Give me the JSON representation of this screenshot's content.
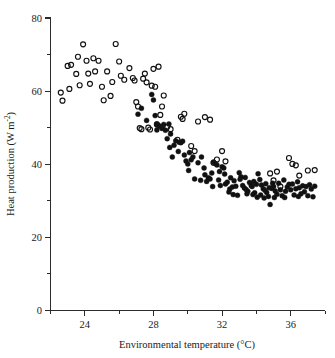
{
  "figure": {
    "title": "",
    "background_color": "#ffffff",
    "ink_color": "#111111"
  },
  "axes": {
    "x": {
      "label_text": "Environmental temperature (",
      "label_unit": "°C)",
      "label_full": "Environmental temperature (°C)",
      "min": 22,
      "max": 38,
      "major_ticks": [
        24,
        28,
        32,
        36
      ],
      "major_tick_labels": [
        "24",
        "28",
        "32",
        "36"
      ],
      "minor_ticks": [
        22,
        26,
        30,
        34,
        38
      ]
    },
    "y": {
      "label_base": "Heat production (W m",
      "label_sup": "-2",
      "label_close": ")",
      "label_full": "Heat production (W m⁻²)",
      "min": 0,
      "max": 80,
      "major_ticks": [
        0,
        20,
        40,
        60,
        80
      ],
      "major_tick_labels": [
        "0",
        "20",
        "40",
        "60",
        "80"
      ],
      "minor_ticks": [
        10,
        30,
        50,
        70
      ]
    }
  },
  "legend": {
    "present": false,
    "series_markers": [
      "open-circle",
      "filled-circle"
    ]
  },
  "chart_data": {
    "type": "scatter",
    "title": "",
    "xlabel": "Environmental temperature (°C)",
    "ylabel": "Heat production (W m⁻²)",
    "xlim": [
      22,
      38
    ],
    "ylim": [
      0,
      80
    ],
    "grid": false,
    "legend_position": "none",
    "series": [
      {
        "name": "Open circles",
        "marker": "open-circle",
        "color": "#111111",
        "points": [
          [
            22.6,
            59.6
          ],
          [
            22.7,
            57.4
          ],
          [
            23.0,
            66.9
          ],
          [
            23.1,
            60.6
          ],
          [
            23.2,
            67.2
          ],
          [
            23.5,
            64.7
          ],
          [
            23.6,
            69.4
          ],
          [
            23.7,
            61.6
          ],
          [
            23.9,
            72.8
          ],
          [
            24.1,
            68.3
          ],
          [
            24.2,
            64.8
          ],
          [
            24.3,
            62.0
          ],
          [
            24.5,
            69.0
          ],
          [
            24.6,
            65.4
          ],
          [
            24.8,
            68.3
          ],
          [
            25.0,
            61.2
          ],
          [
            25.1,
            57.5
          ],
          [
            25.3,
            65.4
          ],
          [
            25.5,
            58.7
          ],
          [
            25.6,
            62.5
          ],
          [
            25.8,
            72.9
          ],
          [
            26.0,
            68.1
          ],
          [
            26.1,
            64.2
          ],
          [
            26.3,
            63.1
          ],
          [
            26.6,
            66.3
          ],
          [
            26.8,
            63.6
          ],
          [
            26.9,
            62.9
          ],
          [
            27.0,
            57.0
          ],
          [
            27.1,
            55.8
          ],
          [
            27.2,
            49.9
          ],
          [
            27.3,
            49.6
          ],
          [
            27.4,
            63.4
          ],
          [
            27.5,
            64.8
          ],
          [
            27.6,
            62.4
          ],
          [
            27.7,
            50.0
          ],
          [
            27.8,
            49.5
          ],
          [
            27.9,
            61.5
          ],
          [
            28.0,
            66.1
          ],
          [
            28.1,
            61.2
          ],
          [
            28.2,
            50.9
          ],
          [
            28.3,
            66.7
          ],
          [
            28.4,
            53.5
          ],
          [
            28.5,
            55.8
          ],
          [
            28.6,
            58.8
          ],
          [
            28.8,
            50.2
          ],
          [
            29.0,
            49.6
          ],
          [
            29.4,
            46.7
          ],
          [
            29.6,
            53.0
          ],
          [
            29.7,
            52.4
          ],
          [
            29.8,
            53.8
          ],
          [
            30.2,
            45.0
          ],
          [
            30.4,
            43.6
          ],
          [
            30.6,
            51.7
          ],
          [
            31.0,
            52.9
          ],
          [
            31.3,
            52.2
          ],
          [
            31.5,
            40.4
          ],
          [
            31.7,
            41.3
          ],
          [
            32.0,
            43.6
          ],
          [
            32.2,
            40.8
          ],
          [
            34.8,
            37.5
          ],
          [
            35.0,
            35.6
          ],
          [
            35.2,
            38.0
          ],
          [
            35.4,
            33.9
          ],
          [
            35.9,
            41.7
          ],
          [
            36.1,
            40.1
          ],
          [
            36.3,
            39.7
          ],
          [
            36.5,
            36.9
          ],
          [
            37.0,
            38.3
          ],
          [
            37.4,
            38.4
          ]
        ]
      },
      {
        "name": "Filled circles",
        "marker": "filled-circle",
        "color": "#111111",
        "points": [
          [
            27.1,
            53.7
          ],
          [
            27.3,
            55.3
          ],
          [
            27.6,
            52.0
          ],
          [
            27.9,
            59.1
          ],
          [
            28.0,
            57.6
          ],
          [
            28.1,
            53.3
          ],
          [
            28.2,
            51.0
          ],
          [
            28.2,
            49.4
          ],
          [
            28.3,
            50.6
          ],
          [
            28.4,
            50.3
          ],
          [
            28.5,
            49.8
          ],
          [
            28.6,
            50.9
          ],
          [
            28.7,
            49.3
          ],
          [
            28.8,
            47.0
          ],
          [
            28.9,
            51.0
          ],
          [
            29.0,
            48.3
          ],
          [
            29.1,
            42.0
          ],
          [
            29.2,
            45.2
          ],
          [
            29.3,
            46.4
          ],
          [
            29.5,
            46.0
          ],
          [
            29.6,
            45.9
          ],
          [
            29.7,
            46.3
          ],
          [
            29.8,
            42.5
          ],
          [
            29.9,
            40.9
          ],
          [
            30.0,
            40.1
          ],
          [
            30.1,
            43.2
          ],
          [
            30.2,
            41.2
          ],
          [
            30.3,
            42.0
          ],
          [
            30.4,
            36.0
          ],
          [
            30.6,
            40.4
          ],
          [
            30.8,
            42.0
          ],
          [
            31.0,
            37.1
          ],
          [
            31.1,
            35.3
          ],
          [
            31.2,
            36.3
          ],
          [
            31.3,
            36.0
          ],
          [
            31.4,
            37.6
          ],
          [
            31.5,
            40.6
          ],
          [
            31.6,
            40.2
          ],
          [
            31.7,
            39.8
          ],
          [
            31.8,
            35.7
          ],
          [
            31.9,
            34.2
          ],
          [
            32.0,
            39.3
          ],
          [
            32.1,
            39.0
          ],
          [
            32.2,
            34.6
          ],
          [
            32.3,
            35.1
          ],
          [
            32.4,
            32.4
          ],
          [
            32.5,
            36.3
          ],
          [
            32.6,
            33.8
          ],
          [
            32.7,
            35.5
          ],
          [
            32.8,
            34.0
          ],
          [
            32.9,
            31.5
          ],
          [
            33.0,
            37.7
          ],
          [
            33.1,
            36.6
          ],
          [
            33.2,
            34.2
          ],
          [
            33.3,
            33.5
          ],
          [
            33.4,
            33.1
          ],
          [
            33.5,
            32.6
          ],
          [
            33.6,
            35.0
          ],
          [
            33.7,
            34.2
          ],
          [
            33.8,
            31.7
          ],
          [
            33.9,
            32.2
          ],
          [
            34.0,
            34.5
          ],
          [
            34.1,
            37.4
          ],
          [
            34.2,
            35.8
          ],
          [
            34.3,
            34.3
          ],
          [
            34.4,
            33.3
          ],
          [
            34.5,
            32.9
          ],
          [
            34.6,
            32.3
          ],
          [
            34.7,
            31.2
          ],
          [
            34.8,
            29.0
          ],
          [
            34.9,
            33.4
          ],
          [
            35.0,
            33.9
          ],
          [
            35.1,
            32.7
          ],
          [
            35.2,
            31.8
          ],
          [
            35.3,
            34.8
          ],
          [
            35.4,
            33.0
          ],
          [
            35.5,
            31.4
          ],
          [
            35.6,
            35.7
          ],
          [
            35.7,
            32.6
          ],
          [
            35.8,
            33.8
          ],
          [
            35.9,
            34.5
          ],
          [
            36.0,
            33.0
          ],
          [
            36.1,
            34.6
          ],
          [
            36.2,
            31.6
          ],
          [
            36.3,
            33.3
          ],
          [
            36.4,
            35.2
          ],
          [
            36.5,
            33.6
          ],
          [
            36.6,
            31.9
          ],
          [
            36.7,
            34.1
          ],
          [
            36.8,
            32.5
          ],
          [
            36.9,
            33.9
          ],
          [
            37.0,
            31.4
          ],
          [
            37.1,
            34.4
          ],
          [
            37.2,
            33.2
          ],
          [
            37.3,
            31.1
          ],
          [
            37.4,
            34.0
          ],
          [
            33.05,
            35.9
          ],
          [
            33.45,
            31.9
          ],
          [
            34.25,
            31.6
          ],
          [
            34.05,
            31.0
          ],
          [
            32.45,
            33.2
          ],
          [
            33.75,
            33.9
          ],
          [
            34.55,
            34.7
          ],
          [
            35.05,
            30.9
          ],
          [
            31.45,
            33.9
          ],
          [
            30.75,
            35.6
          ],
          [
            29.45,
            43.5
          ],
          [
            28.95,
            44.6
          ],
          [
            30.95,
            39.0
          ],
          [
            32.15,
            37.3
          ],
          [
            33.85,
            35.3
          ],
          [
            34.45,
            30.8
          ],
          [
            34.95,
            34.8
          ],
          [
            35.65,
            30.9
          ],
          [
            36.45,
            31.2
          ],
          [
            30.05,
            38.3
          ],
          [
            31.85,
            38.0
          ],
          [
            32.65,
            31.7
          ],
          [
            33.35,
            36.4
          ],
          [
            34.75,
            33.6
          ]
        ]
      }
    ]
  }
}
